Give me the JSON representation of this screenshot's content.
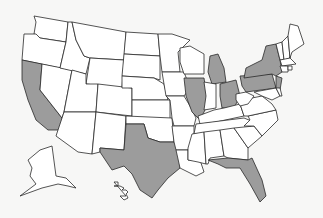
{
  "map": {
    "title": "United States map with highlighted states",
    "colors": {
      "background": "#f7f7f6",
      "state_fill": "#ffffff",
      "highlight_fill": "#9c9c9c",
      "border": "#2a2a2a"
    },
    "highlighted_states": [
      "California",
      "Texas",
      "Illinois",
      "Michigan",
      "Ohio",
      "Pennsylvania",
      "New York",
      "New Jersey",
      "Florida"
    ],
    "states": [
      {
        "name": "Washington",
        "highlighted": false,
        "points": "34,16 68,22 66,42 40,38 34,34 36,22"
      },
      {
        "name": "Oregon",
        "highlighted": false,
        "points": "24,34 36,34 40,38 66,42 60,68 22,60"
      },
      {
        "name": "California",
        "highlighted": true,
        "points": "22,60 42,64 40,90 62,118 60,130 48,130 36,120 28,100 22,80"
      },
      {
        "name": "Nevada",
        "highlighted": false,
        "points": "42,64 72,70 64,112 62,118 40,90"
      },
      {
        "name": "Idaho",
        "highlighted": false,
        "points": "68,22 72,22 76,40 84,56 90,58 86,74 60,68 66,42"
      },
      {
        "name": "Montana",
        "highlighted": false,
        "points": "72,22 126,32 124,60 90,58 84,56 76,40"
      },
      {
        "name": "Wyoming",
        "highlighted": false,
        "points": "90,58 124,60 122,88 86,84"
      },
      {
        "name": "Utah",
        "highlighted": false,
        "points": "72,70 86,74 86,84 98,84 96,112 64,112"
      },
      {
        "name": "Arizona",
        "highlighted": false,
        "points": "64,112 96,112 92,154 78,152 56,136 62,118"
      },
      {
        "name": "Colorado",
        "highlighted": false,
        "points": "98,84 132,88 132,116 96,112"
      },
      {
        "name": "New Mexico",
        "highlighted": false,
        "points": "96,112 126,116 124,150 100,148 100,152 92,154"
      },
      {
        "name": "North Dakota",
        "highlighted": false,
        "points": "126,32 158,34 160,56 124,54"
      },
      {
        "name": "South Dakota",
        "highlighted": false,
        "points": "124,54 160,56 160,80 154,78 122,76"
      },
      {
        "name": "Nebraska",
        "highlighted": false,
        "points": "122,76 154,78 164,84 168,100 132,100 132,88 122,88"
      },
      {
        "name": "Kansas",
        "highlighted": false,
        "points": "132,100 170,100 170,120 132,120"
      },
      {
        "name": "Oklahoma",
        "highlighted": false,
        "points": "126,116 172,118 174,142 160,142 148,138 144,124 126,124"
      },
      {
        "name": "Texas",
        "highlighted": true,
        "points": "126,124 144,124 148,138 160,142 174,142 180,150 180,168 168,178 158,190 152,198 140,190 132,174 124,166 112,170 100,152 100,148 124,150"
      },
      {
        "name": "Minnesota",
        "highlighted": false,
        "points": "158,34 172,34 190,40 178,52 180,72 162,72 160,56"
      },
      {
        "name": "Iowa",
        "highlighted": false,
        "points": "162,72 184,72 190,88 184,96 166,96 164,84"
      },
      {
        "name": "Missouri",
        "highlighted": false,
        "points": "166,96 184,96 190,106 196,118 194,126 174,126 172,118 170,100"
      },
      {
        "name": "Arkansas",
        "highlighted": false,
        "points": "172,126 194,126 194,134 188,150 176,150 174,142"
      },
      {
        "name": "Louisiana",
        "highlighted": false,
        "points": "176,150 188,150 188,160 200,160 204,172 196,176 180,168"
      },
      {
        "name": "Wisconsin",
        "highlighted": false,
        "points": "180,48 190,46 204,54 204,74 184,74 180,62"
      },
      {
        "name": "Illinois",
        "highlighted": true,
        "points": "184,78 204,78 208,104 200,120 192,112 186,96"
      },
      {
        "name": "Michigan",
        "highlighted": true,
        "points": "210,56 218,54 224,68 226,82 212,84 208,72"
      },
      {
        "name": "Indiana",
        "highlighted": false,
        "points": "204,82 216,84 216,108 204,110 206,96"
      },
      {
        "name": "Ohio",
        "highlighted": true,
        "points": "220,84 236,80 240,96 234,108 222,108 220,96"
      },
      {
        "name": "Kentucky",
        "highlighted": false,
        "points": "198,116 214,110 224,108 240,104 244,116 216,122 200,124"
      },
      {
        "name": "Tennessee",
        "highlighted": false,
        "points": "196,124 244,118 254,122 248,130 194,134"
      },
      {
        "name": "Mississippi",
        "highlighted": false,
        "points": "192,134 204,132 206,164 198,162 188,160 188,148"
      },
      {
        "name": "Alabama",
        "highlighted": false,
        "points": "204,132 220,130 224,156 210,158 208,164 206,164"
      },
      {
        "name": "Georgia",
        "highlighted": false,
        "points": "220,130 234,128 248,148 248,160 228,158 224,156"
      },
      {
        "name": "Florida",
        "highlighted": true,
        "points": "208,160 228,158 248,160 252,158 262,180 266,196 260,202 250,184 240,168 226,168 218,164"
      },
      {
        "name": "South Carolina",
        "highlighted": false,
        "points": "234,128 254,126 262,136 248,148"
      },
      {
        "name": "North Carolina",
        "highlighted": false,
        "points": "248,116 276,110 278,120 262,136 254,126 244,126 250,120"
      },
      {
        "name": "Virginia",
        "highlighted": false,
        "points": "240,104 252,98 262,96 272,104 276,110 248,116 244,116"
      },
      {
        "name": "West Virginia",
        "highlighted": false,
        "points": "236,94 246,92 254,96 248,104 240,106 236,100"
      },
      {
        "name": "Pennsylvania",
        "highlighted": true,
        "points": "240,76 272,74 276,88 246,92 242,86"
      },
      {
        "name": "New York",
        "highlighted": true,
        "points": "246,68 262,60 266,46 276,44 280,60 282,72 276,76 272,74 244,78"
      },
      {
        "name": "New Jersey",
        "highlighted": true,
        "points": "276,76 282,78 280,90 276,90"
      },
      {
        "name": "Maryland",
        "highlighted": false,
        "points": "254,92 276,88 280,96 272,100 262,96"
      },
      {
        "name": "Delaware",
        "highlighted": false,
        "points": "276,88 280,88 282,96 280,96"
      },
      {
        "name": "Vermont",
        "highlighted": false,
        "points": "276,44 282,42 284,60 280,60"
      },
      {
        "name": "New Hampshire",
        "highlighted": false,
        "points": "282,42 288,36 290,58 284,60"
      },
      {
        "name": "Maine",
        "highlighted": false,
        "points": "288,36 290,24 298,26 304,44 292,52 290,58"
      },
      {
        "name": "Massachusetts",
        "highlighted": false,
        "points": "280,60 290,58 296,64 282,66"
      },
      {
        "name": "Connecticut",
        "highlighted": false,
        "points": "280,66 288,66 288,72 282,72"
      },
      {
        "name": "Rhode Island",
        "highlighted": false,
        "points": "288,66 292,66 292,70 288,70"
      },
      {
        "name": "Alaska",
        "highlighted": false,
        "points": "40,150 52,146 56,176 66,178 76,188 68,186 58,184 42,188 20,196 36,184 30,176 32,168 28,160"
      },
      {
        "name": "Hawaii",
        "highlighted": false,
        "points": "114,182 118,182 118,186 114,186 120,186 124,188 122,190 126,190 128,192 126,194 128,198 124,200 120,196 126,196"
      }
    ]
  }
}
